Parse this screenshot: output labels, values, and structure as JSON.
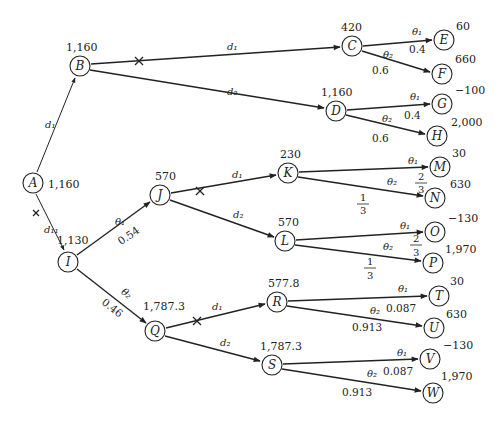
{
  "diagram": {
    "type": "decision-tree",
    "nodes": {
      "A": {
        "label": "A",
        "value": "1,160",
        "x": 33,
        "y": 183
      },
      "B": {
        "label": "B",
        "value": "1,160",
        "x": 80,
        "y": 66
      },
      "C": {
        "label": "C",
        "value": "420",
        "x": 352,
        "y": 46
      },
      "D": {
        "label": "D",
        "value": "1,160",
        "x": 336,
        "y": 111
      },
      "E": {
        "label": "E",
        "value": "60",
        "x": 444,
        "y": 40
      },
      "F": {
        "label": "F",
        "value": "660",
        "x": 442,
        "y": 74
      },
      "G": {
        "label": "G",
        "value": "−100",
        "x": 442,
        "y": 104
      },
      "H": {
        "label": "H",
        "value": "2,000",
        "x": 437,
        "y": 136
      },
      "I": {
        "label": "I",
        "value": "1,130",
        "x": 68,
        "y": 262
      },
      "J": {
        "label": "J",
        "value": "570",
        "x": 160,
        "y": 195
      },
      "K": {
        "label": "K",
        "value": "230",
        "x": 288,
        "y": 173
      },
      "L": {
        "label": "L",
        "value": "570",
        "x": 285,
        "y": 241
      },
      "M": {
        "label": "M",
        "value": "30",
        "x": 440,
        "y": 167
      },
      "N": {
        "label": "N",
        "value": "630",
        "x": 435,
        "y": 198
      },
      "O": {
        "label": "O",
        "value": "−130",
        "x": 435,
        "y": 232
      },
      "P": {
        "label": "P",
        "value": "1,970",
        "x": 433,
        "y": 263
      },
      "Q": {
        "label": "Q",
        "value": "1,787.3",
        "x": 155,
        "y": 331
      },
      "R": {
        "label": "R",
        "value": "577.8",
        "x": 277,
        "y": 302
      },
      "S": {
        "label": "S",
        "value": "1,787.3",
        "x": 272,
        "y": 365
      },
      "T": {
        "label": "T",
        "value": "30",
        "x": 439,
        "y": 296
      },
      "U": {
        "label": "U",
        "value": "630",
        "x": 434,
        "y": 328
      },
      "V": {
        "label": "V",
        "value": "−130",
        "x": 430,
        "y": 359
      },
      "W": {
        "label": "W",
        "value": "1,970",
        "x": 433,
        "y": 393
      }
    },
    "edges": [
      {
        "from": "A",
        "to": "B",
        "label": "d₁",
        "pruned": false
      },
      {
        "from": "A",
        "to": "I",
        "label": "d₁₁",
        "pruned": true
      },
      {
        "from": "B",
        "to": "C",
        "label": "d₁",
        "pruned": true
      },
      {
        "from": "B",
        "to": "D",
        "label": "d₂",
        "pruned": false
      },
      {
        "from": "C",
        "to": "E",
        "label": "θ₁",
        "prob": "0.4"
      },
      {
        "from": "C",
        "to": "F",
        "label": "θ₂",
        "prob": "0.6"
      },
      {
        "from": "D",
        "to": "G",
        "label": "θ₁",
        "prob": "0.4"
      },
      {
        "from": "D",
        "to": "H",
        "label": "θ₂",
        "prob": "0.6"
      },
      {
        "from": "I",
        "to": "J",
        "label": "θ₁",
        "prob": "0.54"
      },
      {
        "from": "I",
        "to": "Q",
        "label": "θ₂",
        "prob": "0.46"
      },
      {
        "from": "J",
        "to": "K",
        "label": "d₁",
        "pruned": true
      },
      {
        "from": "J",
        "to": "L",
        "label": "d₂",
        "pruned": false
      },
      {
        "from": "K",
        "to": "M",
        "label": "θ₁",
        "prob": "2/3"
      },
      {
        "from": "K",
        "to": "N",
        "label": "θ₂",
        "prob": "1/3"
      },
      {
        "from": "L",
        "to": "O",
        "label": "θ₁",
        "prob": "2/3"
      },
      {
        "from": "L",
        "to": "P",
        "label": "θ₂",
        "prob": "1/3"
      },
      {
        "from": "Q",
        "to": "R",
        "label": "d₁",
        "pruned": true
      },
      {
        "from": "Q",
        "to": "S",
        "label": "d₂",
        "pruned": false
      },
      {
        "from": "R",
        "to": "T",
        "label": "θ₁",
        "prob": "0.087"
      },
      {
        "from": "R",
        "to": "U",
        "label": "θ₂",
        "prob": "0.913"
      },
      {
        "from": "S",
        "to": "V",
        "label": "θ₁",
        "prob": "0.087"
      },
      {
        "from": "S",
        "to": "W",
        "label": "θ₂",
        "prob": "0.913"
      }
    ]
  },
  "labels": {
    "d1": "d₁",
    "d2": "d₂",
    "dI": "d₁",
    "dII": "d₁₁",
    "theta1": "θ₁",
    "theta2": "θ₂",
    "p04": "0.4",
    "p06": "0.6",
    "p054": "0.54",
    "p046": "0.46",
    "p0087": "0.087",
    "p0913": "0.913",
    "frac_num_2": "2",
    "frac_num_1": "1",
    "frac_den_3": "3"
  }
}
